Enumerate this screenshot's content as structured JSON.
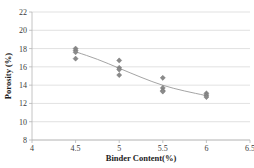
{
  "chart_data": {
    "type": "scatter",
    "title": "",
    "xlabel": "Binder Content(%)",
    "ylabel": "Porosity (%)",
    "xlim": [
      4,
      6.5
    ],
    "ylim": [
      8,
      22
    ],
    "xticks": [
      "4",
      "4.5",
      "5",
      "5.5",
      "6",
      "6.5"
    ],
    "xtick_values": [
      4,
      4.5,
      5,
      5.5,
      6,
      6.5
    ],
    "yticks": [
      "8",
      "10",
      "12",
      "14",
      "16",
      "18",
      "20",
      "22"
    ],
    "ytick_values": [
      8,
      10,
      12,
      14,
      16,
      18,
      20,
      22
    ],
    "grid": "horizontal",
    "legend": "none",
    "marker_shape": "diamond",
    "marker_color": "#8a8a8a",
    "trendline_color": "#9a9a9a",
    "points": [
      {
        "x": 4.5,
        "y": 18.0
      },
      {
        "x": 4.5,
        "y": 17.8
      },
      {
        "x": 4.5,
        "y": 17.6
      },
      {
        "x": 4.5,
        "y": 16.9
      },
      {
        "x": 5.0,
        "y": 16.7
      },
      {
        "x": 5.0,
        "y": 15.9
      },
      {
        "x": 5.0,
        "y": 15.7
      },
      {
        "x": 5.0,
        "y": 15.1
      },
      {
        "x": 5.5,
        "y": 14.8
      },
      {
        "x": 5.5,
        "y": 13.7
      },
      {
        "x": 5.5,
        "y": 13.4
      },
      {
        "x": 5.5,
        "y": 13.3
      },
      {
        "x": 6.0,
        "y": 13.1
      },
      {
        "x": 6.0,
        "y": 12.9
      },
      {
        "x": 6.0,
        "y": 12.7
      }
    ],
    "trendline": [
      {
        "x": 4.5,
        "y": 17.65
      },
      {
        "x": 4.75,
        "y": 16.85
      },
      {
        "x": 5.0,
        "y": 15.85
      },
      {
        "x": 5.25,
        "y": 14.85
      },
      {
        "x": 5.5,
        "y": 13.95
      },
      {
        "x": 5.75,
        "y": 13.35
      },
      {
        "x": 6.0,
        "y": 12.85
      }
    ]
  }
}
